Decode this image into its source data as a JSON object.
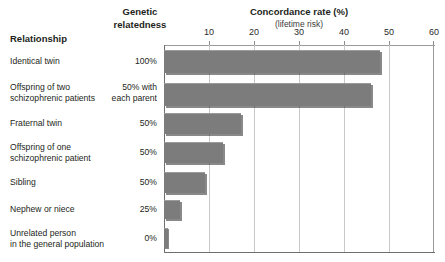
{
  "header": {
    "col_relationship": "Relationship",
    "col_genetic": "Genetic\nrelatedness",
    "chart_title": "Concordance rate (%)",
    "chart_subtitle": "(lifetime risk)"
  },
  "axis": {
    "ticks": [
      "10",
      "20",
      "30",
      "40",
      "50",
      "60"
    ]
  },
  "rows": [
    {
      "relationship": "Identical twin",
      "relatedness": "100%",
      "value": 48
    },
    {
      "relationship": "Offspring of two\nschizophrenic patients",
      "relatedness": "50% with\neach parent",
      "value": 46
    },
    {
      "relationship": "Fraternal twin",
      "relatedness": "50%",
      "value": 17
    },
    {
      "relationship": "Offspring of one\nschizophrenic patient",
      "relatedness": "50%",
      "value": 13
    },
    {
      "relationship": "Sibling",
      "relatedness": "50%",
      "value": 9
    },
    {
      "relationship": "Nephew or niece",
      "relatedness": "25%",
      "value": 3.5
    },
    {
      "relationship": "Unrelated person\nin the general population",
      "relatedness": "0%",
      "value": 0.8
    }
  ],
  "colors": {
    "bar_fill": "#7c7c7c",
    "bar_shadow": "#3a3a3a",
    "gridline": "#c9c9c9",
    "axis": "#6e6e6e",
    "text": "#231f20",
    "background": "#ffffff"
  },
  "chart_data": {
    "type": "bar",
    "orientation": "horizontal",
    "title": "Concordance rate (%)",
    "subtitle": "(lifetime risk)",
    "xlabel": "Concordance rate (%)",
    "ylabel": "Relationship",
    "xlim": [
      0,
      60
    ],
    "xticks": [
      0,
      10,
      20,
      30,
      40,
      50,
      60
    ],
    "xticklabels": [
      "",
      "10",
      "20",
      "30",
      "40",
      "50",
      "60"
    ],
    "grid": true,
    "legend": false,
    "categories": [
      "Identical twin",
      "Offspring of two schizophrenic patients",
      "Fraternal twin",
      "Offspring of one schizophrenic patient",
      "Sibling",
      "Nephew or niece",
      "Unrelated person in the general population"
    ],
    "values": [
      48,
      46,
      17,
      13,
      9,
      3.5,
      0.8
    ],
    "annotations": {
      "genetic_relatedness": [
        "100%",
        "50% with each parent",
        "50%",
        "50%",
        "50%",
        "25%",
        "0%"
      ]
    }
  }
}
